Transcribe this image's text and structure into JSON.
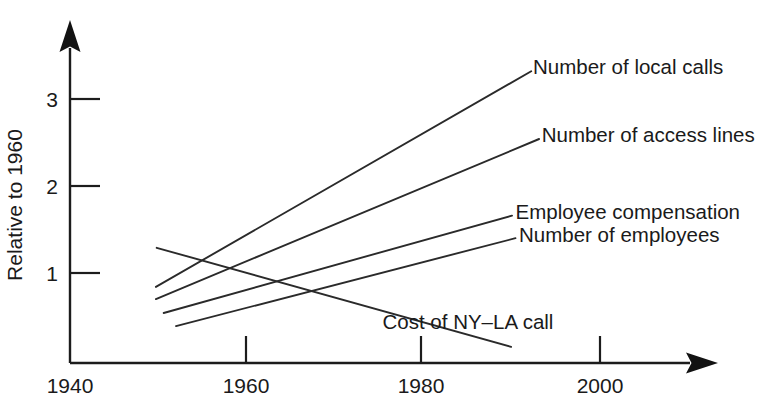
{
  "chart_data": {
    "type": "line",
    "title": "",
    "subtitle": "",
    "xlabel": "",
    "ylabel": "Relative to 1960",
    "xlim": [
      1937,
      2007
    ],
    "ylim": [
      0,
      3.7
    ],
    "xticks": [
      1940,
      1960,
      1980,
      2000
    ],
    "xtick_labels": [
      "1940",
      "1960",
      "1980",
      "2000"
    ],
    "yticks": [
      1,
      2,
      3
    ],
    "ytick_labels": [
      "1",
      "2",
      "3"
    ],
    "grid": false,
    "legend_position": "inline-right-of-line-ends",
    "annotation": "All five series are indexed so that each equals 1 in 1960; the lines converge at (1960, 1).",
    "series": [
      {
        "name": "Number of local calls",
        "label": "Number of local calls",
        "label_x": 1992.8,
        "label_y": 3.35,
        "x": [
          1949.7,
          1992.6
        ],
        "y": [
          0.84,
          3.32
        ]
      },
      {
        "name": "Number of access lines",
        "label": "Number of access lines",
        "label_x": 1993.8,
        "label_y": 2.57,
        "x": [
          1949.7,
          1993.5
        ],
        "y": [
          0.7,
          2.54
        ]
      },
      {
        "name": "Employee compensation",
        "label": "Employee compensation",
        "label_x": 1990.8,
        "label_y": 1.68,
        "x": [
          1950.6,
          1990.4
        ],
        "y": [
          0.54,
          1.66
        ]
      },
      {
        "name": "Number of employees",
        "label": "Number of employees",
        "label_x": 1991.2,
        "label_y": 1.42,
        "x": [
          1952.0,
          1990.8
        ],
        "y": [
          0.39,
          1.4
        ]
      },
      {
        "name": "Cost of NY-LA call",
        "label": "Cost of NY–LA call",
        "label_x": 1975.6,
        "label_y": 0.42,
        "x": [
          1949.8,
          1990.3
        ],
        "y": [
          1.29,
          0.15
        ]
      }
    ]
  },
  "axes": {
    "y_axis_title": "Relative to 1960",
    "x_axis_title": ""
  },
  "icons": {
    "x_axis_arrow": "arrow-right-icon",
    "y_axis_arrow": "arrow-up-icon"
  },
  "colors": {
    "ink": "#1a1a1a",
    "line": "#2a2a2a",
    "background": "#ffffff"
  }
}
